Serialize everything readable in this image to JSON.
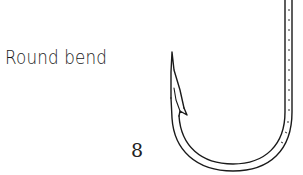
{
  "diagram": {
    "label": "Round bend",
    "figure_number": "8",
    "line_color": "#1a1a1a",
    "background_color": "#ffffff"
  }
}
